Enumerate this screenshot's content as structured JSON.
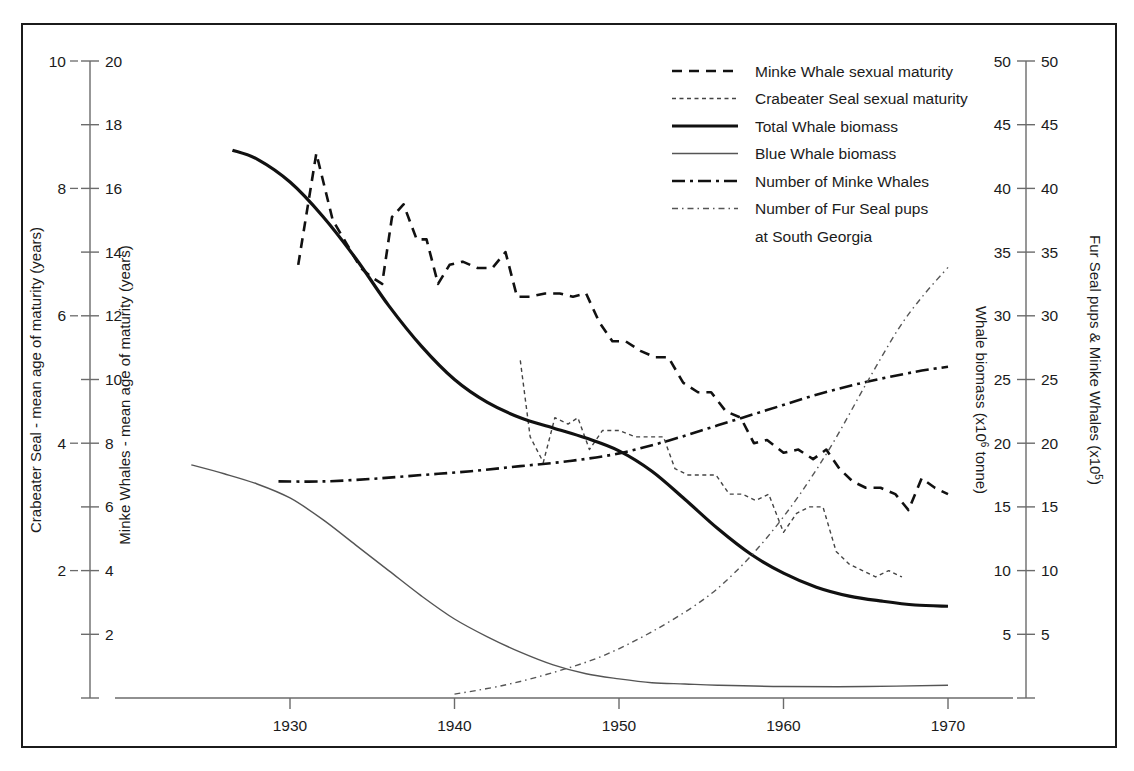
{
  "chart_data": {
    "type": "line",
    "title": "",
    "xlabel": "",
    "x_ticks": [
      1930,
      1940,
      1950,
      1960,
      1970
    ],
    "xlim": [
      1923,
      1973
    ],
    "grid": false,
    "legend_position": "top-center-right",
    "axes": {
      "left_outer": {
        "label": "Crabeater Seal - mean age of maturity (years)",
        "ticks": [
          2,
          4,
          6,
          8,
          10
        ],
        "range": [
          0,
          10
        ]
      },
      "left_inner": {
        "label": "Minke Whales - mean age of maturity (years)",
        "ticks": [
          2,
          4,
          6,
          8,
          10,
          12,
          14,
          16,
          18,
          20
        ],
        "range": [
          0,
          20
        ]
      },
      "right_inner": {
        "label": "Whale biomass (x10⁶ tonne)",
        "label_main": "Whale biomass (x10",
        "label_sup": "6",
        "label_tail": " tonne)",
        "ticks": [
          5,
          10,
          15,
          20,
          25,
          30,
          35,
          40,
          45,
          50
        ],
        "range": [
          0,
          50
        ]
      },
      "right_outer": {
        "label": "Fur Seal pups & Minke Whales (x10⁵)",
        "label_main": "Fur Seal pups & Minke Whales (x10",
        "label_sup": "5",
        "label_tail": ")",
        "ticks": [
          5,
          10,
          15,
          20,
          25,
          30,
          35,
          40,
          45,
          50
        ],
        "range": [
          0,
          50
        ]
      }
    },
    "legend": [
      {
        "label": "Minke Whale sexual maturity",
        "style": "dashed-bold",
        "axis": "left_inner"
      },
      {
        "label": "Crabeater Seal sexual maturity",
        "style": "dotted-thin",
        "axis": "left_outer"
      },
      {
        "label": "Total Whale biomass",
        "style": "solid-bold",
        "axis": "right_inner"
      },
      {
        "label": "Blue Whale biomass",
        "style": "solid-thin",
        "axis": "right_inner"
      },
      {
        "label": "Number of Minke Whales",
        "style": "dashdot-bold",
        "axis": "right_outer"
      },
      {
        "label": "Number of Fur Seal pups",
        "style": "dashdotdot-thin",
        "axis": "right_outer"
      },
      {
        "label": "at South Georgia",
        "style": "continuation",
        "axis": ""
      }
    ],
    "series": [
      {
        "name": "Minke Whale sexual maturity",
        "axis": "left_inner",
        "units": "years",
        "points": [
          [
            1930.5,
            13.6
          ],
          [
            1931.6,
            17.1
          ],
          [
            1932.6,
            15.0
          ],
          [
            1933.4,
            14.3
          ],
          [
            1934.3,
            13.5
          ],
          [
            1935.0,
            13.2
          ],
          [
            1935.6,
            13.0
          ],
          [
            1936.2,
            15.1
          ],
          [
            1936.9,
            15.5
          ],
          [
            1937.7,
            14.4
          ],
          [
            1938.3,
            14.4
          ],
          [
            1939.0,
            13.0
          ],
          [
            1939.7,
            13.6
          ],
          [
            1940.5,
            13.7
          ],
          [
            1941.4,
            13.5
          ],
          [
            1942.3,
            13.5
          ],
          [
            1943.1,
            14.0
          ],
          [
            1943.8,
            12.6
          ],
          [
            1944.6,
            12.6
          ],
          [
            1945.5,
            12.7
          ],
          [
            1946.4,
            12.7
          ],
          [
            1947.2,
            12.6
          ],
          [
            1948.0,
            12.7
          ],
          [
            1948.8,
            11.8
          ],
          [
            1949.6,
            11.2
          ],
          [
            1950.4,
            11.2
          ],
          [
            1951.3,
            10.9
          ],
          [
            1952.2,
            10.7
          ],
          [
            1953.0,
            10.7
          ],
          [
            1953.9,
            9.9
          ],
          [
            1954.8,
            9.6
          ],
          [
            1955.6,
            9.6
          ],
          [
            1956.5,
            9.0
          ],
          [
            1957.4,
            8.8
          ],
          [
            1958.2,
            8.0
          ],
          [
            1959.0,
            8.1
          ],
          [
            1960.0,
            7.7
          ],
          [
            1960.9,
            7.8
          ],
          [
            1961.8,
            7.5
          ],
          [
            1962.6,
            7.8
          ],
          [
            1963.4,
            7.2
          ],
          [
            1964.2,
            6.8
          ],
          [
            1965.0,
            6.6
          ],
          [
            1965.9,
            6.6
          ],
          [
            1966.8,
            6.4
          ],
          [
            1967.6,
            5.9
          ],
          [
            1968.4,
            6.9
          ],
          [
            1969.2,
            6.6
          ],
          [
            1970.0,
            6.4
          ]
        ]
      },
      {
        "name": "Crabeater Seal sexual maturity",
        "axis": "left_outer",
        "units": "years",
        "points": [
          [
            1944.0,
            5.3
          ],
          [
            1944.6,
            4.1
          ],
          [
            1945.4,
            3.7
          ],
          [
            1946.1,
            4.4
          ],
          [
            1946.9,
            4.3
          ],
          [
            1947.5,
            4.4
          ],
          [
            1948.2,
            3.9
          ],
          [
            1949.0,
            4.2
          ],
          [
            1950.0,
            4.2
          ],
          [
            1951.0,
            4.1
          ],
          [
            1951.9,
            4.1
          ],
          [
            1952.7,
            4.1
          ],
          [
            1953.4,
            3.6
          ],
          [
            1954.2,
            3.5
          ],
          [
            1955.0,
            3.5
          ],
          [
            1955.9,
            3.5
          ],
          [
            1956.7,
            3.2
          ],
          [
            1957.5,
            3.2
          ],
          [
            1958.3,
            3.1
          ],
          [
            1959.1,
            3.2
          ],
          [
            1960.0,
            2.6
          ],
          [
            1960.8,
            2.9
          ],
          [
            1961.6,
            3.0
          ],
          [
            1962.4,
            3.0
          ],
          [
            1963.2,
            2.3
          ],
          [
            1964.0,
            2.1
          ],
          [
            1964.8,
            2.0
          ],
          [
            1965.6,
            1.9
          ],
          [
            1966.4,
            2.0
          ],
          [
            1967.2,
            1.9
          ]
        ]
      },
      {
        "name": "Total Whale biomass",
        "axis": "right_inner",
        "units": "x10^6 tonne",
        "points": [
          [
            1926.5,
            43.0
          ],
          [
            1928.0,
            42.3
          ],
          [
            1930.0,
            40.5
          ],
          [
            1932.0,
            37.8
          ],
          [
            1934.0,
            34.5
          ],
          [
            1936.0,
            30.8
          ],
          [
            1938.0,
            27.6
          ],
          [
            1940.0,
            25.0
          ],
          [
            1942.0,
            23.2
          ],
          [
            1944.0,
            22.0
          ],
          [
            1946.0,
            21.2
          ],
          [
            1948.0,
            20.4
          ],
          [
            1950.0,
            19.4
          ],
          [
            1952.0,
            17.8
          ],
          [
            1954.0,
            15.6
          ],
          [
            1956.0,
            13.3
          ],
          [
            1958.0,
            11.3
          ],
          [
            1960.0,
            9.8
          ],
          [
            1962.0,
            8.7
          ],
          [
            1964.0,
            8.0
          ],
          [
            1966.0,
            7.6
          ],
          [
            1968.0,
            7.3
          ],
          [
            1970.0,
            7.2
          ]
        ]
      },
      {
        "name": "Blue Whale biomass",
        "axis": "right_inner",
        "units": "x10^6 tonne",
        "points": [
          [
            1924.0,
            18.3
          ],
          [
            1926.0,
            17.6
          ],
          [
            1928.0,
            16.8
          ],
          [
            1930.0,
            15.7
          ],
          [
            1932.0,
            14.0
          ],
          [
            1934.0,
            12.0
          ],
          [
            1936.0,
            10.0
          ],
          [
            1938.0,
            8.0
          ],
          [
            1940.0,
            6.2
          ],
          [
            1942.0,
            4.8
          ],
          [
            1944.0,
            3.6
          ],
          [
            1946.0,
            2.6
          ],
          [
            1948.0,
            1.9
          ],
          [
            1950.0,
            1.5
          ],
          [
            1952.0,
            1.2
          ],
          [
            1954.0,
            1.1
          ],
          [
            1956.0,
            1.0
          ],
          [
            1960.0,
            0.9
          ],
          [
            1965.0,
            0.9
          ],
          [
            1970.0,
            1.0
          ]
        ]
      },
      {
        "name": "Number of Minke Whales",
        "axis": "right_outer",
        "units": "x10^5",
        "points": [
          [
            1929.3,
            17.0
          ],
          [
            1932.0,
            17.0
          ],
          [
            1935.0,
            17.2
          ],
          [
            1938.0,
            17.5
          ],
          [
            1941.0,
            17.8
          ],
          [
            1944.0,
            18.2
          ],
          [
            1947.0,
            18.6
          ],
          [
            1950.0,
            19.2
          ],
          [
            1953.0,
            20.2
          ],
          [
            1956.0,
            21.4
          ],
          [
            1959.0,
            22.6
          ],
          [
            1962.0,
            23.8
          ],
          [
            1965.0,
            24.8
          ],
          [
            1968.0,
            25.6
          ],
          [
            1970.0,
            26.0
          ]
        ]
      },
      {
        "name": "Number of Fur Seal pups at South Georgia",
        "axis": "right_outer",
        "units": "x10^5",
        "points": [
          [
            1940.0,
            0.3
          ],
          [
            1943.0,
            1.0
          ],
          [
            1946.0,
            2.0
          ],
          [
            1949.0,
            3.3
          ],
          [
            1952.0,
            5.2
          ],
          [
            1955.0,
            7.6
          ],
          [
            1957.0,
            9.8
          ],
          [
            1959.0,
            12.6
          ],
          [
            1961.0,
            16.0
          ],
          [
            1963.0,
            20.0
          ],
          [
            1965.0,
            24.6
          ],
          [
            1967.0,
            29.0
          ],
          [
            1968.5,
            31.6
          ],
          [
            1970.0,
            33.8
          ]
        ]
      }
    ]
  }
}
